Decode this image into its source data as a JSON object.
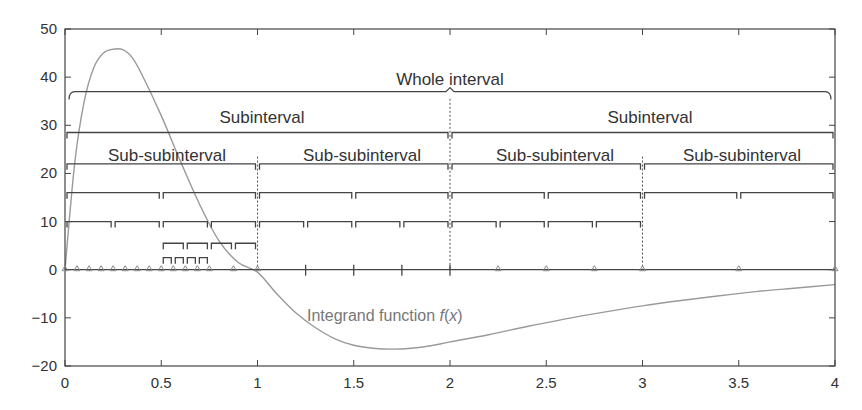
{
  "chart_data": {
    "type": "line",
    "title": "",
    "xlabel": "",
    "ylabel": "",
    "xlim": [
      0,
      4
    ],
    "ylim": [
      -20,
      50
    ],
    "grid": false,
    "x_ticks": [
      "0",
      "0.5",
      "1",
      "1.5",
      "2",
      "2.5",
      "3",
      "3.5",
      "4"
    ],
    "y_ticks": [
      "50",
      "40",
      "30",
      "20",
      "10",
      "0",
      "-10",
      "-20"
    ],
    "series": [
      {
        "name": "Integrand function f(x)",
        "color": "#9a9a9a",
        "x": [
          0,
          0.05,
          0.1,
          0.15,
          0.2,
          0.25,
          0.3,
          0.35,
          0.4,
          0.5,
          0.6,
          0.7,
          0.8,
          0.9,
          1.0,
          1.1,
          1.2,
          1.3,
          1.4,
          1.5,
          1.6,
          1.7,
          1.8,
          1.9,
          2.0,
          2.2,
          2.4,
          2.6,
          2.8,
          3.0,
          3.2,
          3.4,
          3.6,
          3.8,
          4.0
        ],
        "y": [
          0,
          22,
          35,
          42,
          45,
          45.8,
          45.7,
          44,
          40.5,
          32,
          22.5,
          13.5,
          6,
          1.5,
          -0.5,
          -5,
          -9,
          -12,
          -14.3,
          -15.7,
          -16.3,
          -16.5,
          -16.3,
          -15.8,
          -15,
          -13.5,
          -11.8,
          -10.2,
          -8.8,
          -7.5,
          -6.4,
          -5.4,
          -4.5,
          -3.8,
          -3.1
        ]
      }
    ],
    "annotations": {
      "whole_interval": {
        "label": "Whole interval",
        "y": 37,
        "x0": 0,
        "x1": 4
      },
      "subintervals": {
        "label": "Subinterval",
        "y": 28.5,
        "splits": [
          0,
          2,
          4
        ]
      },
      "sub_subintervals": {
        "label": "Sub-subinterval",
        "y": 22,
        "splits": [
          0,
          1,
          2,
          3,
          4
        ]
      },
      "level_16": {
        "y": 16,
        "splits": [
          0,
          0.5,
          1,
          1.5,
          2,
          2.5,
          3,
          3.5,
          4
        ]
      },
      "level_10": {
        "y": 10,
        "splits": [
          0,
          0.25,
          0.5,
          0.75,
          1,
          1.25,
          1.5,
          1.75,
          2,
          2.25,
          2.5,
          2.75,
          3
        ]
      },
      "level_5_5": {
        "y": 5.5,
        "splits": [
          0.5,
          0.625,
          0.75,
          0.875,
          1
        ]
      },
      "level_2_5": {
        "y": 2.5,
        "splits": [
          0.5,
          0.5625,
          0.625,
          0.6875,
          0.75
        ]
      },
      "triangle_nodes_x": [
        0,
        0.0625,
        0.125,
        0.1875,
        0.25,
        0.3125,
        0.375,
        0.4375,
        0.5,
        0.5625,
        0.625,
        0.6875,
        0.75,
        0.875,
        1,
        2.25,
        2.5,
        2.75,
        3,
        3.5,
        4
      ],
      "zero_line_ticks_x": [
        1.25,
        1.5,
        1.75,
        2
      ],
      "dashed_dividers_x": [
        1,
        2,
        3
      ]
    },
    "legend": "none",
    "curve_label": "Integrand function f(x)"
  },
  "labels": {
    "whole": "Whole interval",
    "sub": "Subinterval",
    "subsub": "Sub-subinterval",
    "fx_prefix": "Integrand function ",
    "fx_f": "f",
    "fx_open": "(",
    "fx_x": "x",
    "fx_close": ")"
  }
}
